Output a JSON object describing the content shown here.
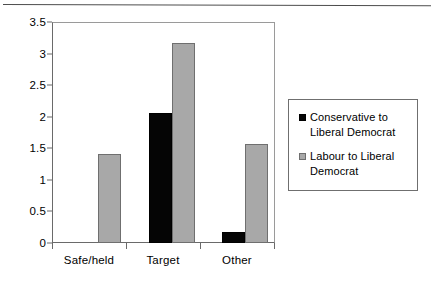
{
  "chart_data": {
    "type": "bar",
    "title": "",
    "subtitle": "",
    "xlabel": "",
    "ylabel": "",
    "categories": [
      "Safe/held",
      "Target",
      "Other"
    ],
    "series": [
      {
        "name": "Conservative to Liberal Democrat",
        "legend_line_1": "Conservative to",
        "legend_line_2": "Liberal Democrat",
        "color": "#050505",
        "values": [
          0,
          2.07,
          0.18
        ]
      },
      {
        "name": "Labour to Liberal Democrat",
        "legend_line_1": "Labour to Liberal",
        "legend_line_2": "Democrat",
        "color": "#a8a8a8",
        "values": [
          1.41,
          3.19,
          1.58
        ]
      }
    ],
    "ylim": [
      0,
      3.5
    ],
    "yticks": [
      0,
      0.5,
      1,
      1.5,
      2,
      2.5,
      3,
      3.5
    ],
    "ytick_labels": [
      "0",
      "0.5",
      "1",
      "1.5",
      "2",
      "2.5",
      "3",
      "3.5"
    ],
    "grid": false,
    "legend_position": "right"
  },
  "colors": {
    "series_conservative": "#050505",
    "series_labour": "#a8a8a8",
    "axis": "#6a6a6a",
    "frame": "#9a9a9a",
    "background": "#ffffff"
  }
}
